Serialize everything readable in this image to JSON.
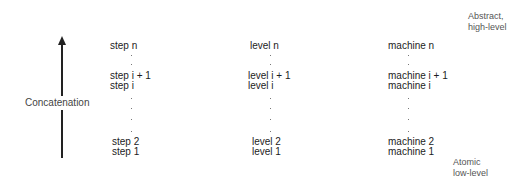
{
  "diagram": {
    "axis": {
      "label": "Concatenation",
      "direction": "up"
    },
    "top_label": {
      "line1": "Abstract,",
      "line2": "high-level"
    },
    "bottom_label": {
      "line1": "Atomic",
      "line2": "low-level"
    },
    "columns": [
      {
        "name": "steps",
        "top": "step n",
        "upper": "step i + 1",
        "middle": "step i",
        "second": "step 2",
        "first": "step 1"
      },
      {
        "name": "levels",
        "top": "level n",
        "upper": "level i + 1",
        "middle": "level i",
        "second": "level 2",
        "first": "level 1"
      },
      {
        "name": "machines",
        "top": "machine n",
        "upper": "machine i + 1",
        "middle": "machine i",
        "second": "machine 2",
        "first": "machine 1"
      }
    ]
  }
}
